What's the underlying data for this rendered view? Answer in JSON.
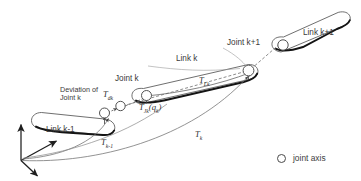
{
  "figure": {
    "background_color": "#ffffff",
    "line_color": "#4a4a4a",
    "bold_edge_color": "#1a1a1a",
    "text_color": "#3a3a3a"
  },
  "labels": {
    "link_k_minus_1": "Link k-1",
    "link_k": "Link k",
    "link_k_plus_1": "Link k+1",
    "joint_k": "Joint k",
    "joint_k_plus_1": "Joint k+1",
    "deviation_line1": "Deviation of",
    "deviation_line2": "Joint k"
  },
  "transforms": {
    "t_dk": {
      "base": "T",
      "sub": "dk"
    },
    "t_jk": {
      "base": "T",
      "sub": "Jk",
      "arg": "(q",
      "arg_sub": "k",
      "arg_close": ")"
    },
    "t_lk": {
      "base": "T",
      "sub": "Lk"
    },
    "t_k_minus_1": {
      "base": "T",
      "sub": "k-1"
    },
    "t_k": {
      "base": "T",
      "sub": "k"
    }
  },
  "legend": {
    "symbol": "joint-axis-circle",
    "text": "joint axis"
  },
  "axes": {
    "name": "base-coordinate-frame",
    "arrow_count": 3
  }
}
